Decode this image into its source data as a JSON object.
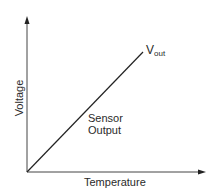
{
  "diagram": {
    "y_axis_label": "Voltage",
    "x_axis_label": "Temperature",
    "line_label_main": "V",
    "line_label_sub": "out",
    "annotation_line1": "Sensor",
    "annotation_line2": "Output",
    "line_color": "#222222",
    "axis_color": "#333333"
  }
}
